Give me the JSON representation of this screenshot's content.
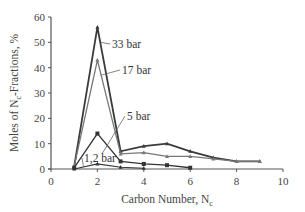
{
  "chart_data": {
    "type": "line",
    "title": "",
    "xlabel": "Carbon Number, N",
    "xlabel_sub": "c",
    "ylabel": "Moles of N",
    "ylabel_sub": "c",
    "ylabel_suffix": "-Fractions, %",
    "xlim": [
      0,
      10
    ],
    "ylim": [
      0,
      60
    ],
    "xticks": [
      0,
      2,
      4,
      6,
      8,
      10
    ],
    "yticks": [
      0,
      10,
      20,
      30,
      40,
      50,
      60
    ],
    "grid": false,
    "legend": "inline-annotations",
    "series": [
      {
        "name": "33 bar",
        "color": "#3a3a3a",
        "width": 1.8,
        "marker": "triangle",
        "x": [
          1,
          2,
          3,
          4,
          5,
          6,
          7,
          8,
          9
        ],
        "values": [
          1,
          56,
          7,
          9,
          10,
          7,
          4.5,
          3,
          3
        ],
        "label_pos": [
          112,
          48
        ],
        "label_anchor": [
          2.15,
          50
        ]
      },
      {
        "name": "17 bar",
        "color": "#777777",
        "width": 1.3,
        "marker": "triangle",
        "x": [
          1,
          2,
          3,
          4,
          5,
          6,
          7,
          8,
          9
        ],
        "values": [
          1,
          43,
          6,
          6.5,
          5,
          5,
          4,
          3,
          3
        ],
        "label_pos": [
          122,
          74
        ],
        "label_anchor": [
          2.15,
          37
        ]
      },
      {
        "name": "5 bar",
        "color": "#333333",
        "width": 1.3,
        "marker": "square",
        "x": [
          1,
          2,
          3,
          4,
          5,
          6
        ],
        "values": [
          0.5,
          14,
          3,
          2,
          1.5,
          0.5
        ],
        "label_pos": [
          127,
          120
        ],
        "label_anchor": [
          2.2,
          6
        ]
      },
      {
        "name": "1,2 bar",
        "color": "#333333",
        "width": 1.1,
        "marker": "triangle",
        "x": [
          1,
          2,
          3,
          4
        ],
        "values": [
          0,
          2,
          0.7,
          0.3
        ],
        "label_pos": [
          84,
          162
        ],
        "label_anchor": [
          1.4,
          1
        ]
      }
    ]
  }
}
